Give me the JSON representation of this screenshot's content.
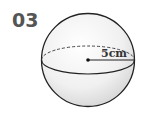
{
  "problem": {
    "number": "03"
  },
  "figure": {
    "shape": "sphere",
    "radius_label": "5cm",
    "colors": {
      "outline": "#222222",
      "fill_light": "#ffffff",
      "fill_shade": "#d9d9d9"
    }
  }
}
